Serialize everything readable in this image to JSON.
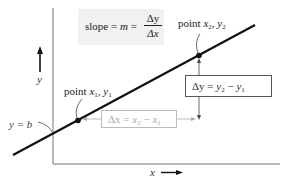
{
  "diagram": {
    "slope_formula": {
      "lhs": "slope = ",
      "m": "m",
      "eq": " = ",
      "numerator": "Δy",
      "denominator": "Δx"
    },
    "point1_label": {
      "prefix": "point ",
      "x": "x",
      "x_sub": "1",
      "sep": ", ",
      "y": "y",
      "y_sub": "1"
    },
    "point2_label": {
      "prefix": "point ",
      "x": "x",
      "x_sub": "2",
      "sep": ", ",
      "y": "y",
      "y_sub": "2"
    },
    "delta_y_box": {
      "lhs": "Δy",
      "eq": " = ",
      "a": "y",
      "a_sub": "2",
      "minus": " − ",
      "b": "y",
      "b_sub": "1"
    },
    "delta_x_box": {
      "lhs": "Δx",
      "eq": " = ",
      "a": "x",
      "a_sub": "2",
      "minus": " − ",
      "b": "x",
      "b_sub": "1"
    },
    "intercept_label": "y = b",
    "x_axis_label": "x",
    "y_axis_label": "y",
    "colors": {
      "line": "#111111",
      "axis": "#666666",
      "slope_box_bg": "#f1f1f1",
      "delta_x_color": "#aaaaaa",
      "delta_y_color": "#444444"
    }
  }
}
